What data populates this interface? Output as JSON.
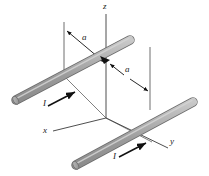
{
  "figure": {
    "type": "physics-diagram",
    "background_color": "#ffffff",
    "line_color": "#3a3a3a",
    "rod_fill_color": "#a8a8a8",
    "rod_edge_color": "#6b6b6b",
    "arrow_color": "#111111"
  },
  "axes": [
    {
      "name": "z",
      "label": "z",
      "label_x": 103,
      "label_y": 2
    },
    {
      "name": "x",
      "label": "x",
      "label_x": 43,
      "label_y": 132
    },
    {
      "name": "y",
      "label": "y",
      "label_x": 170,
      "label_y": 142
    }
  ],
  "dimensions": [
    {
      "name": "a-left",
      "label": "a",
      "label_x": 82,
      "label_y": 38
    },
    {
      "name": "a-right",
      "label": "a",
      "label_x": 125,
      "label_y": 70
    }
  ],
  "currents": [
    {
      "name": "I-upper-rod",
      "label": "I",
      "label_x": 43,
      "label_y": 104
    },
    {
      "name": "I-lower-rod",
      "label": "I",
      "label_x": 113,
      "label_y": 158
    }
  ],
  "rods": [
    {
      "name": "upper-rod",
      "x1": 13,
      "y1": 101,
      "x2": 133,
      "y2": 38
    },
    {
      "name": "lower-rod",
      "x1": 73,
      "y1": 166,
      "x2": 196,
      "y2": 100
    }
  ]
}
